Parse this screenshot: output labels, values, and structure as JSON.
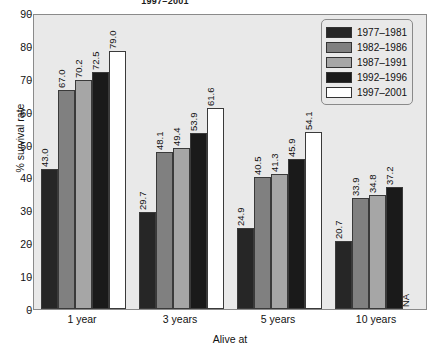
{
  "super_title": "1997–2001",
  "axes": {
    "ylabel": "% survival rate",
    "xlabel": "Alive at",
    "yticks": [
      "0",
      "10",
      "20",
      "30",
      "40",
      "50",
      "60",
      "70",
      "80",
      "90"
    ]
  },
  "legend": {
    "items": [
      {
        "label": "1977–1981",
        "color": "#262626"
      },
      {
        "label": "1982–1986",
        "color": "#808080"
      },
      {
        "label": "1987–1991",
        "color": "#a6a6a6"
      },
      {
        "label": "1992–1996",
        "color": "#1a1a1a"
      },
      {
        "label": "1997–2001",
        "color": "#ffffff"
      }
    ]
  },
  "chart_data": {
    "type": "bar",
    "title": "1997–2001",
    "xlabel": "Alive at",
    "ylabel": "% survival rate",
    "ylim": [
      0,
      90
    ],
    "ytick_step": 10,
    "grid": false,
    "legend_position": "top-right",
    "categories": [
      "1 year",
      "3 years",
      "5 years",
      "10 years"
    ],
    "series": [
      {
        "name": "1977–1981",
        "color": "#262626",
        "values": [
          43.0,
          29.7,
          24.9,
          20.7
        ],
        "labels": [
          "43.0",
          "29.7",
          "24.9",
          "20.7"
        ]
      },
      {
        "name": "1982–1986",
        "color": "#808080",
        "values": [
          67.0,
          48.1,
          40.5,
          33.9
        ],
        "labels": [
          "67.0",
          "48.1",
          "40.5",
          "33.9"
        ]
      },
      {
        "name": "1987–1991",
        "color": "#a6a6a6",
        "values": [
          70.2,
          49.4,
          41.3,
          34.8
        ],
        "labels": [
          "70.2",
          "49.4",
          "41.3",
          "34.8"
        ]
      },
      {
        "name": "1992–1996",
        "color": "#1a1a1a",
        "values": [
          72.5,
          53.9,
          45.9,
          37.2
        ],
        "labels": [
          "72.5",
          "53.9",
          "45.9",
          "37.2"
        ]
      },
      {
        "name": "1997–2001",
        "color": "#ffffff",
        "values": [
          79.0,
          61.6,
          54.1,
          null
        ],
        "labels": [
          "79.0",
          "61.6",
          "54.1",
          "NA"
        ]
      }
    ]
  }
}
